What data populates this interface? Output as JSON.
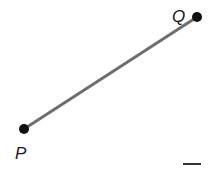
{
  "diagram": {
    "type": "line-segment",
    "points": [
      {
        "name": "P",
        "x": 24,
        "y": 129,
        "label_x": 16,
        "label_y": 158
      },
      {
        "name": "Q",
        "x": 197,
        "y": 17,
        "label_x": 172,
        "label_y": 22
      }
    ],
    "segment": {
      "from": "P",
      "to": "Q",
      "color": "#6e6e6e",
      "width": 3
    },
    "point_color": "#111111",
    "answer_blank": {
      "x1": 183,
      "y1": 164,
      "x2": 201,
      "y2": 164,
      "color": "#333333"
    }
  },
  "labels": {
    "p": "P",
    "q": "Q"
  }
}
